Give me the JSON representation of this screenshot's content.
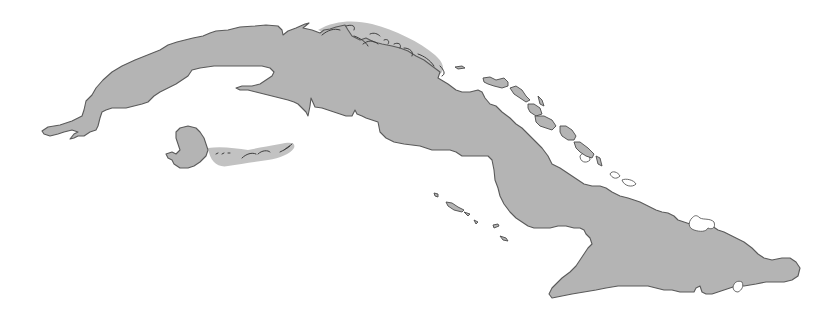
{
  "map": {
    "subject": "Cuba",
    "features": [
      {
        "name": "main-island",
        "label": "Cuba"
      },
      {
        "name": "isla-de-la-juventud",
        "label": "Isla de la Juventud"
      },
      {
        "name": "archipielago-de-los-canarreos",
        "label": "Archipiélago de los Canarreos"
      },
      {
        "name": "archipielago-sabana-camaguey",
        "label": "Archipiélago Sabana-Camagüey"
      },
      {
        "name": "jardines-de-la-reina",
        "label": "Jardines de la Reina"
      }
    ],
    "colors": {
      "land": "#b4b4b4",
      "coastline": "#5a5a5a",
      "water": "#ffffff"
    }
  }
}
